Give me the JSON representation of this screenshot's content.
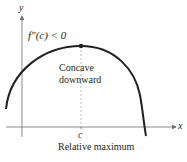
{
  "diagram": {
    "condition_label": "f″(c) < 0",
    "concavity_label_line1": "Concave",
    "concavity_label_line2": "downward",
    "x_axis_label": "x",
    "y_axis_label": "y",
    "point_label": "c",
    "caption": "Relative maximum",
    "colors": {
      "curve": "#231f20",
      "axis": "#6d6e71",
      "dashed": "#a7a9ac"
    }
  }
}
